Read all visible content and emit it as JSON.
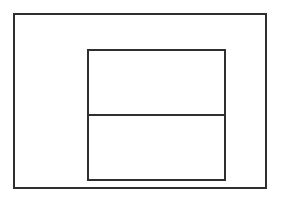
{
  "diagram": {
    "background_color": "#ffffff",
    "line_color": "#2f2f2f",
    "shapes": [
      {
        "name": "outer-rectangle",
        "type": "rectangle"
      },
      {
        "name": "inner-rectangle",
        "type": "rectangle"
      },
      {
        "name": "horizontal-divider",
        "type": "line"
      }
    ],
    "text_labels": []
  }
}
